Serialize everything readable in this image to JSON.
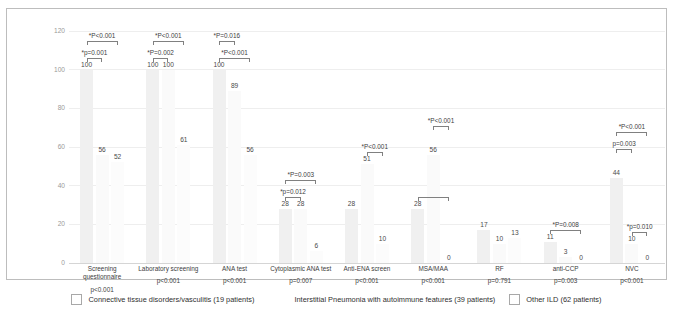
{
  "chart_data": {
    "type": "bar",
    "title": "",
    "xlabel": "",
    "ylabel": "",
    "ylim": [
      0,
      120
    ],
    "yticks": [
      0,
      20,
      40,
      60,
      80,
      100,
      120
    ],
    "grid": true,
    "legend_position": "bottom",
    "categories": [
      "Screening questionnaire",
      "Laboratory screening",
      "ANA test",
      "Cytoplasmic ANA test",
      "Anti-ENA screen",
      "MSA/MAA",
      "RF",
      "anti-CCP",
      "NVC"
    ],
    "category_pvalues": [
      "p<0.001",
      "p<0.001",
      "p<0.001",
      "p=0.007",
      "p<0.001",
      "p<0.001",
      "p=0.791",
      "p=0.003",
      "p<0.001"
    ],
    "series": [
      {
        "name": "Connective tissue disorders/vasculitis (19 patients)",
        "values": [
          100,
          100,
          100,
          28,
          28,
          28,
          17,
          11,
          44
        ]
      },
      {
        "name": "Interstitial Pneumonia with autoimmune features (39 patients)",
        "values": [
          56,
          100,
          89,
          28,
          51,
          56,
          10,
          3,
          10
        ]
      },
      {
        "name": "Other ILD (62 patients)",
        "values": [
          52,
          61,
          56,
          6,
          10,
          0,
          13,
          0,
          0
        ]
      }
    ],
    "annotations": [
      {
        "group": 0,
        "from": 0,
        "to": 2,
        "label": "*P<0.001",
        "level": 2
      },
      {
        "group": 0,
        "from": 0,
        "to": 1,
        "label": "*p=0.001",
        "level": 1
      },
      {
        "group": 1,
        "from": 0,
        "to": 2,
        "label": "*P<0.001",
        "level": 2
      },
      {
        "group": 1,
        "from": 0,
        "to": 1,
        "label": "*P=0.002",
        "level": 1
      },
      {
        "group": 2,
        "from": 0,
        "to": 1,
        "label": "*P=0.016",
        "level": 2
      },
      {
        "group": 2,
        "from": 0,
        "to": 2,
        "label": "*P<0.001",
        "level": 1
      },
      {
        "group": 3,
        "from": 0,
        "to": 2,
        "label": "*P=0.003",
        "level": 2
      },
      {
        "group": 3,
        "from": 0,
        "to": 1,
        "label": "*p=0.012",
        "level": 1
      },
      {
        "group": 4,
        "from": 1,
        "to": 2,
        "label": "*P<0.001",
        "level": 1
      },
      {
        "group": 5,
        "from": 1,
        "to": 2,
        "label": "*P<0.001",
        "level": 2
      },
      {
        "group": 5,
        "from": 0,
        "to": 2,
        "label": "",
        "level": 1
      },
      {
        "group": 7,
        "from": 0,
        "to": 2,
        "label": "*P=0.008",
        "level": 1
      },
      {
        "group": 8,
        "from": 0,
        "to": 2,
        "label": "*P<0.001",
        "level": 3
      },
      {
        "group": 8,
        "from": 0,
        "to": 1,
        "label": "p=0.003",
        "level": 2
      },
      {
        "group": 8,
        "from": 1,
        "to": 2,
        "label": "*p=0.010",
        "level": 1
      }
    ]
  },
  "legend": {
    "items": [
      {
        "label": "Connective tissue disorders/vasculitis (19 patients)"
      },
      {
        "label": "Interstitial Pneumonia with autoimmune features (39 patients)"
      },
      {
        "label": "Other ILD (62 patients)"
      }
    ]
  },
  "yticks": {
    "t0": "0",
    "t20": "20",
    "t40": "40",
    "t60": "60",
    "t80": "80",
    "t100": "100",
    "t120": "120"
  }
}
